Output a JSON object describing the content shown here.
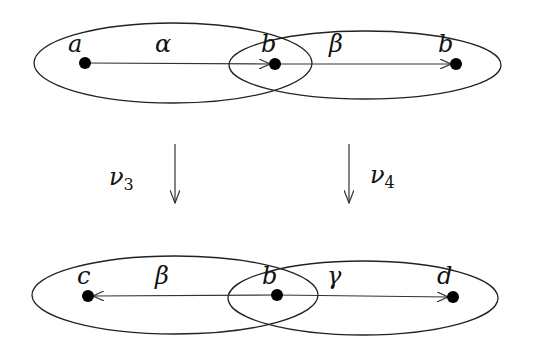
{
  "diagram": {
    "top_row": {
      "nodes": [
        {
          "id": "top-a",
          "label": "a",
          "x": 85,
          "y": 63
        },
        {
          "id": "top-b1",
          "label": "b",
          "x": 275,
          "y": 64
        },
        {
          "id": "top-b2",
          "label": "b",
          "x": 456,
          "y": 64
        }
      ],
      "edges": [
        {
          "label": "α",
          "from": "top-a",
          "to": "top-b1"
        },
        {
          "label": "β",
          "from": "top-b1",
          "to": "top-b2"
        }
      ]
    },
    "maps": [
      {
        "label": "ν",
        "subscript": "3"
      },
      {
        "label": "ν",
        "subscript": "4"
      }
    ],
    "bottom_row": {
      "nodes": [
        {
          "id": "bot-c",
          "label": "c",
          "x": 88,
          "y": 296
        },
        {
          "id": "bot-b",
          "label": "b",
          "x": 277,
          "y": 295
        },
        {
          "id": "bot-d",
          "label": "d",
          "x": 453,
          "y": 297
        }
      ],
      "edges": [
        {
          "label": "β",
          "from": "bot-b",
          "to": "bot-c"
        },
        {
          "label": "γ",
          "from": "bot-b",
          "to": "bot-d"
        }
      ]
    }
  }
}
